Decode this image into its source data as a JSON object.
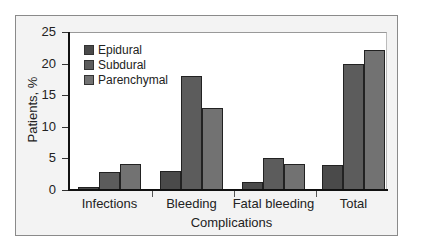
{
  "chart_data": {
    "type": "bar",
    "title": "",
    "xlabel": "Complications",
    "ylabel": "Patients, %",
    "ylim": [
      0,
      25
    ],
    "yticks": [
      0,
      5,
      10,
      15,
      20,
      25
    ],
    "grid": false,
    "legend_position": "upper-left",
    "categories": [
      "Infections",
      "Bleeding",
      "Fatal bleeding",
      "Total"
    ],
    "series": [
      {
        "name": "Epidural",
        "color": "#4a4a4a",
        "values": [
          0.5,
          3.0,
          1.2,
          3.9
        ]
      },
      {
        "name": "Subdural",
        "color": "#5c5c5c",
        "values": [
          2.8,
          18.0,
          5.0,
          20.0
        ]
      },
      {
        "name": "Parenchymal",
        "color": "#727272",
        "values": [
          4.1,
          13.0,
          4.1,
          22.2
        ]
      }
    ]
  }
}
